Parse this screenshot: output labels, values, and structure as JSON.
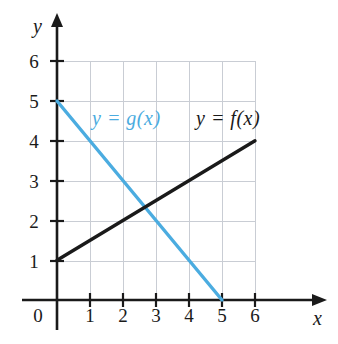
{
  "figure": {
    "background_color": "#ffffff",
    "width": 338,
    "height": 344
  },
  "axes": {
    "x_axis_label": "x",
    "y_axis_label": "y",
    "origin_label": "0",
    "x_ticks": [
      "1",
      "2",
      "3",
      "4",
      "5",
      "6"
    ],
    "y_ticks": [
      "6",
      "5",
      "4",
      "3",
      "2",
      "1"
    ],
    "grid_color": "#c9cdd4",
    "axis_color": "#1a1a1a"
  },
  "legend": {
    "g_label": "y = g(x)",
    "f_label": "y = f(x)"
  },
  "colors": {
    "g_line": "#4BACE0",
    "f_line": "#1a1a1a"
  },
  "chart_data": {
    "type": "line",
    "title": "",
    "xlabel": "x",
    "ylabel": "y",
    "xlim": [
      0,
      6
    ],
    "ylim": [
      0,
      6
    ],
    "xticks": [
      0,
      1,
      2,
      3,
      4,
      5,
      6
    ],
    "yticks": [
      0,
      1,
      2,
      3,
      4,
      5,
      6
    ],
    "grid": true,
    "legend_position": "inside-top",
    "series": [
      {
        "name": "y = f(x)",
        "color": "#1a1a1a",
        "equation": "f(x) = 1 + x/2",
        "slope": 0.5,
        "intercept": 1,
        "x": [
          0,
          6
        ],
        "values": [
          1,
          4
        ],
        "endpoints": [
          [
            0,
            1
          ],
          [
            6,
            4
          ]
        ]
      },
      {
        "name": "y = g(x)",
        "color": "#4BACE0",
        "equation": "g(x) = 5 - x",
        "slope": -1,
        "intercept": 5,
        "x": [
          0,
          5
        ],
        "values": [
          5,
          0
        ],
        "endpoints": [
          [
            0,
            5
          ],
          [
            5,
            0
          ]
        ]
      }
    ],
    "intersection": [
      2.6667,
      2.3333
    ]
  }
}
